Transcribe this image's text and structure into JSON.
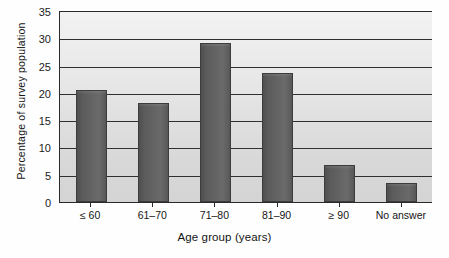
{
  "chart_data": {
    "type": "bar",
    "title": "",
    "xlabel": "Age group (years)",
    "ylabel": "Percentage of survey population",
    "categories": [
      "≤ 60",
      "61–70",
      "71–80",
      "81–90",
      "≥ 90",
      "No answer"
    ],
    "values": [
      20.5,
      18.1,
      29.2,
      23.6,
      6.8,
      3.4
    ],
    "ylim": [
      0,
      35
    ],
    "yticks": [
      0,
      5,
      10,
      15,
      20,
      25,
      30,
      35
    ],
    "ytick_labels": [
      "0",
      "5",
      "10",
      "15",
      "20",
      "25",
      "30",
      "35"
    ],
    "grid": true,
    "grid_axis": "y",
    "legend": false,
    "legend_position": "none",
    "bar_color": "#5f5f5f",
    "plot_background": "#e6e6e6",
    "axis_color": "#2a2a2a",
    "figure_background": "#ffffff"
  }
}
